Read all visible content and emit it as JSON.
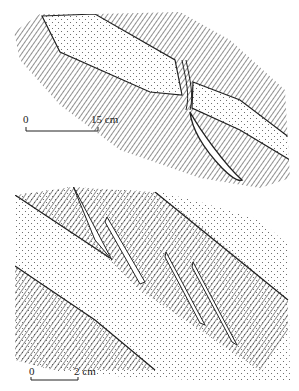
{
  "figure": {
    "panels": [
      {
        "id": "top",
        "description": "Competent stippled layer in foliated (hatched) matrix, offset across a drag zone with a lens below",
        "scale_bar": {
          "start_label": "0",
          "end_label": "15 cm"
        }
      },
      {
        "id": "bottom",
        "description": "Stippled layers with en-echelon lenses/veins within hatched band",
        "scale_bar": {
          "start_label": "0",
          "end_label": "2 cm"
        }
      }
    ],
    "colors": {
      "ink": "#222222",
      "background": "#ffffff"
    }
  }
}
